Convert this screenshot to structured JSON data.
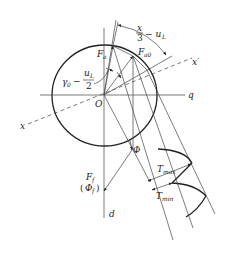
{
  "diagram": {
    "labels": {
      "angle_top_num": "x",
      "angle_top_den": "3",
      "angle_top_rest": "− u",
      "angle_top_sub": "L",
      "Fa": "F",
      "Fa_sub": "a",
      "Fa0": "F",
      "Fa0_sub": "a0",
      "gamma": "γ",
      "gamma_sub": "0",
      "gamma_minus": "−",
      "gamma_num": "u",
      "gamma_num_sub": "L",
      "gamma_den": "2",
      "x_prime": "x′",
      "q": "q",
      "O": "O",
      "x": "x",
      "Phi": "Φ",
      "Ff": "F",
      "Ff_sub": "f",
      "Phi_f_open": "(",
      "Phi_f": "Φ",
      "Phi_f_sub": "f",
      "Phi_f_close": ")",
      "d": "d",
      "Tmax": "T",
      "Tmax_sub": "max",
      "Tmin": "T",
      "Tmin_sub": "min"
    },
    "colors": {
      "line": "#444444",
      "text": "#222222",
      "background": "#ffffff"
    }
  }
}
